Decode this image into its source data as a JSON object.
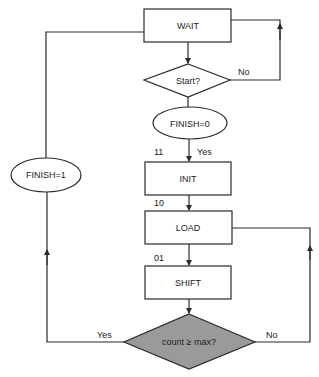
{
  "diagram": {
    "type": "flowchart",
    "colors": {
      "stroke": "#2a2a2a",
      "decision_fill_gray": "#9a9a9a",
      "background": "#ffffff"
    },
    "nodes": {
      "wait": {
        "label": "WAIT",
        "shape": "rectangle"
      },
      "start": {
        "label": "Start?",
        "shape": "diamond"
      },
      "finish0": {
        "label": "FINISH=0",
        "shape": "ellipse"
      },
      "init": {
        "label": "INIT",
        "shape": "rectangle",
        "state_code": "11"
      },
      "load": {
        "label": "LOAD",
        "shape": "rectangle",
        "state_code": "10"
      },
      "shift": {
        "label": "SHIFT",
        "shape": "rectangle",
        "state_code": "01"
      },
      "count_check": {
        "label": "count ≥ max?",
        "shape": "diamond"
      },
      "finish1": {
        "label": "FINISH=1",
        "shape": "ellipse"
      }
    },
    "edges": {
      "start_no": "No",
      "start_yes": "Yes",
      "count_yes": "Yes",
      "count_no": "No"
    }
  }
}
